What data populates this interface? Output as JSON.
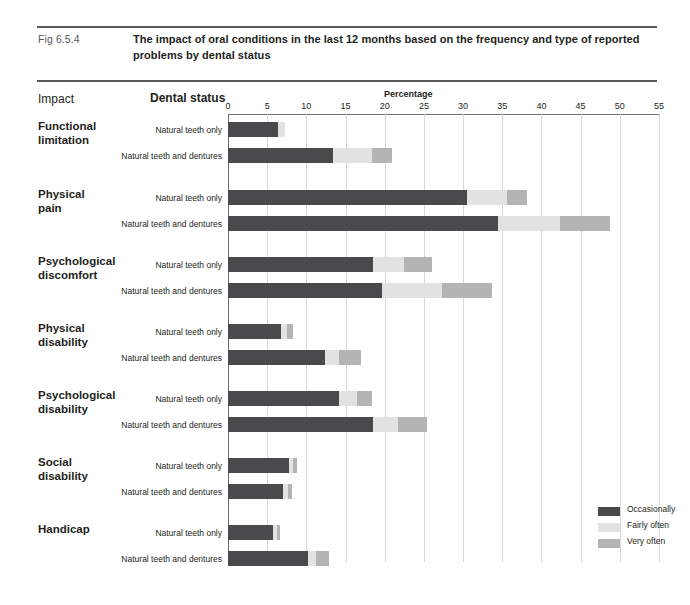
{
  "figure": {
    "number": "Fig 6.5.4",
    "title": "The impact of oral conditions in the last 12 months based on the frequency and type of reported problems by dental status",
    "corner_mark": ""
  },
  "headers": {
    "impact": "Impact",
    "dental_status": "Dental status",
    "percentage": "Percentage"
  },
  "chart_data": {
    "type": "bar",
    "orientation": "horizontal",
    "stacked": true,
    "title": "The impact of oral conditions in the last 12 months based on the frequency and type of reported problems by dental status",
    "xlabel": "Percentage",
    "ylabel": "Impact",
    "xlim": [
      0,
      55
    ],
    "xticks": [
      0,
      5,
      10,
      15,
      20,
      25,
      30,
      35,
      40,
      45,
      50,
      55
    ],
    "grid": true,
    "legend_position": "bottom-right",
    "series": [
      {
        "name": "Occasionally",
        "color": "#4a4a4c"
      },
      {
        "name": "Fairly often",
        "color": "#e2e3e1"
      },
      {
        "name": "Very often",
        "color": "#b3b4b4"
      }
    ],
    "groups": [
      {
        "impact": "Functional\nlimitation",
        "rows": [
          {
            "dental_status": "Natural teeth only",
            "occasionally": 6.4,
            "fairly_often": 0.9,
            "very_often": 0.0
          },
          {
            "dental_status": "Natural teeth and dentures",
            "occasionally": 13.4,
            "fairly_often": 5.0,
            "very_often": 2.5
          }
        ]
      },
      {
        "impact": "Physical\npain",
        "rows": [
          {
            "dental_status": "Natural teeth only",
            "occasionally": 30.5,
            "fairly_often": 5.1,
            "very_often": 2.6
          },
          {
            "dental_status": "Natural teeth and dentures",
            "occasionally": 34.5,
            "fairly_often": 7.9,
            "very_often": 6.3
          }
        ]
      },
      {
        "impact": "Psychological\ndiscomfort",
        "rows": [
          {
            "dental_status": "Natural teeth only",
            "occasionally": 18.5,
            "fairly_often": 4.0,
            "very_often": 3.5
          },
          {
            "dental_status": "Natural teeth and dentures",
            "occasionally": 19.7,
            "fairly_often": 7.6,
            "very_often": 6.4
          }
        ]
      },
      {
        "impact": "Physical\ndisability",
        "rows": [
          {
            "dental_status": "Natural teeth only",
            "occasionally": 6.8,
            "fairly_often": 0.7,
            "very_often": 0.8
          },
          {
            "dental_status": "Natural teeth and dentures",
            "occasionally": 12.4,
            "fairly_often": 1.8,
            "very_often": 2.8
          }
        ]
      },
      {
        "impact": "Psychological\ndisability",
        "rows": [
          {
            "dental_status": "Natural teeth only",
            "occasionally": 14.2,
            "fairly_often": 2.2,
            "very_often": 2.0
          },
          {
            "dental_status": "Natural teeth and dentures",
            "occasionally": 18.5,
            "fairly_often": 3.2,
            "very_often": 3.7
          }
        ]
      },
      {
        "impact": "Social\ndisability",
        "rows": [
          {
            "dental_status": "Natural teeth only",
            "occasionally": 7.8,
            "fairly_often": 0.5,
            "very_often": 0.5
          },
          {
            "dental_status": "Natural teeth and dentures",
            "occasionally": 7.0,
            "fairly_often": 0.7,
            "very_often": 0.5
          }
        ]
      },
      {
        "impact": "Handicap",
        "rows": [
          {
            "dental_status": "Natural teeth only",
            "occasionally": 5.7,
            "fairly_often": 0.5,
            "very_often": 0.4
          },
          {
            "dental_status": "Natural teeth and dentures",
            "occasionally": 10.2,
            "fairly_often": 1.0,
            "very_often": 1.7
          }
        ]
      }
    ]
  },
  "legend": [
    {
      "label": "Occasionally",
      "color": "#4a4a4c"
    },
    {
      "label": "Fairly often",
      "color": "#e2e3e1"
    },
    {
      "label": "Very often",
      "color": "#b3b4b4"
    }
  ]
}
